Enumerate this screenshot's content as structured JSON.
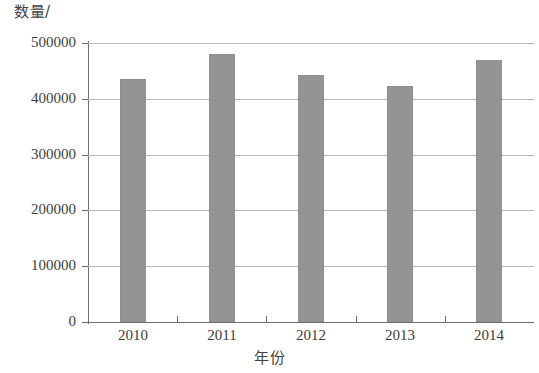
{
  "chart_data": {
    "type": "bar",
    "title": "",
    "subtitle": "",
    "xlabel": "年份",
    "ylabel": "数量/",
    "categories": [
      "2010",
      "2011",
      "2012",
      "2013",
      "2014"
    ],
    "values": [
      435000,
      480000,
      443000,
      423000,
      470000
    ],
    "series": [
      {
        "name": "数量",
        "values": [
          435000,
          480000,
          443000,
          423000,
          470000
        ]
      }
    ],
    "ylim": [
      0,
      500000
    ],
    "ytick_labels": [
      "0",
      "100000",
      "200000",
      "300000",
      "400000",
      "500000"
    ],
    "ytick_values": [
      0,
      100000,
      200000,
      300000,
      400000,
      500000
    ],
    "xtick_labels": [
      "2010",
      "2011",
      "2012",
      "2013",
      "2014"
    ],
    "grid": true,
    "grid_axis": "y",
    "legend": false,
    "legend_position": "none",
    "bar_color": "#949494",
    "grid_color": "#b6b6b6",
    "axis_color": "#6e6e6e",
    "background_color": "#ffffff"
  },
  "axes": {
    "y_title": "数量/",
    "x_title": "年份"
  }
}
